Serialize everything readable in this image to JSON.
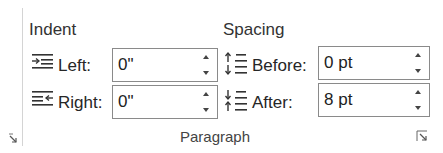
{
  "group": {
    "label": "Paragraph"
  },
  "indent": {
    "header": "Indent",
    "left": {
      "label": "Left:",
      "value": "0\"",
      "icon": "indent-left-icon"
    },
    "right": {
      "label": "Right:",
      "value": "0\"",
      "icon": "indent-right-icon"
    }
  },
  "spacing": {
    "header": "Spacing",
    "before": {
      "label": "Before:",
      "value": "0 pt",
      "icon": "spacing-before-icon"
    },
    "after": {
      "label": "After:",
      "value": "8 pt",
      "icon": "spacing-after-icon"
    }
  },
  "colors": {
    "text": "#262626",
    "border": "#8a8a8a",
    "divider": "#d4d4d4"
  }
}
